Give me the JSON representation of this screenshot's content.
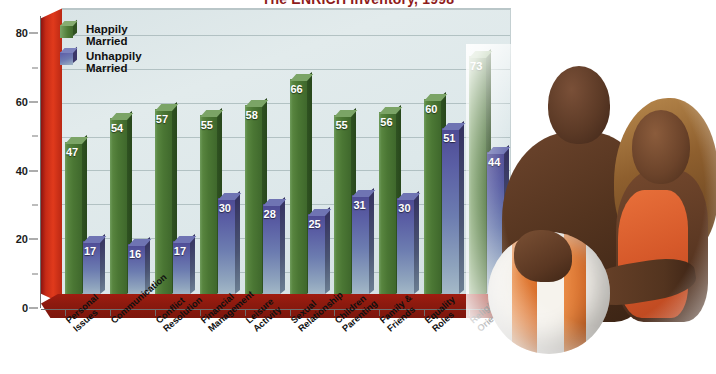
{
  "chart_data": {
    "type": "bar",
    "title": "The ENRICH Inventory, 1998",
    "xlabel": "",
    "ylabel": "",
    "ylim": [
      0,
      85
    ],
    "grid": true,
    "legend_position": "top-left",
    "categories": [
      "Personal Issues",
      "Communication",
      "Conflict Resolution",
      "Financial Management",
      "Leisure Activity",
      "Sexual Relationship",
      "Children Parenting",
      "Family & Friends",
      "Equality Roles",
      "Religious Orientation"
    ],
    "category_lines": [
      [
        "Personal",
        "Issues"
      ],
      [
        "Communication",
        ""
      ],
      [
        "Conflict",
        "Resolution"
      ],
      [
        "Financial",
        "Management"
      ],
      [
        "Leisure",
        "Activity"
      ],
      [
        "Sexual",
        "Relationship"
      ],
      [
        "Children",
        "Parenting"
      ],
      [
        "Family &",
        "Friends"
      ],
      [
        "Equality",
        "Roles"
      ],
      [
        "Religious",
        "Orientation"
      ]
    ],
    "series": [
      {
        "name": "Happily Married",
        "color": "#4b7734",
        "values": [
          47,
          54,
          57,
          55,
          58,
          66,
          55,
          56,
          60,
          73
        ]
      },
      {
        "name": "Unhappily Married",
        "color": "#5a5ea4",
        "values": [
          17,
          16,
          17,
          30,
          28,
          25,
          31,
          30,
          51,
          44
        ]
      }
    ],
    "yticks_major": [
      0,
      20,
      40,
      60,
      80
    ],
    "yticks_minor": [
      10,
      30,
      50,
      70
    ]
  },
  "legend": {
    "items": [
      {
        "label": "Happily Married"
      },
      {
        "label": "Unhappily Married"
      }
    ]
  },
  "colors": {
    "wall": "#c62b16",
    "floor": "#8d1a0e",
    "plot_background": "#dde8ea",
    "green_series": "#4b7734",
    "blue_series": "#5a5ea4",
    "title_text": "#8e1b1b"
  },
  "photo": {
    "caption": "Photograph of a smiling couple holding an orange and white beach ball"
  }
}
